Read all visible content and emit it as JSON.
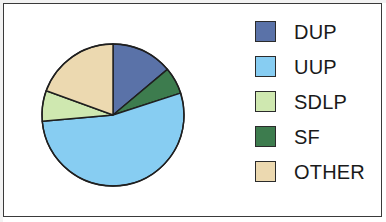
{
  "figure": {
    "background_color": "#ffffff",
    "border_color": "#3a3a3a"
  },
  "legend": {
    "items": [
      {
        "label": "DUP",
        "color": "#5a72a8",
        "border": "#2b2b2b",
        "swatch_name": "legend-swatch-dup"
      },
      {
        "label": "UUP",
        "color": "#87cdf2",
        "border": "#2b2b2b",
        "swatch_name": "legend-swatch-uup"
      },
      {
        "label": "SDLP",
        "color": "#cfe8b0",
        "border": "#2b2b2b",
        "swatch_name": "legend-swatch-sdlp"
      },
      {
        "label": "SF",
        "color": "#3d7c4e",
        "border": "#2b2b2b",
        "swatch_name": "legend-swatch-sf"
      },
      {
        "label": "OTHER",
        "color": "#ecd9b0",
        "border": "#2b2b2b",
        "swatch_name": "legend-swatch-other"
      }
    ]
  },
  "chart_data": {
    "type": "pie",
    "title": "",
    "subtitle": "",
    "xlabel": "",
    "ylabel": "",
    "grid": false,
    "legend_position": "right",
    "start_angle_deg": 0,
    "direction": "clockwise",
    "categories": [
      "DUP",
      "UUP",
      "SDLP",
      "SF",
      "OTHER"
    ],
    "values": [
      13.9,
      53.6,
      6.9,
      6.1,
      19.4
    ],
    "units": "percent",
    "slices": [
      {
        "label": "DUP",
        "value": 13.9,
        "color": "#5a72a8",
        "start_angle_deg": 0,
        "end_angle_deg": 50
      },
      {
        "label": "SF",
        "value": 6.1,
        "color": "#3d7c4e",
        "start_angle_deg": 50,
        "end_angle_deg": 72
      },
      {
        "label": "UUP",
        "value": 53.6,
        "color": "#87cdf2",
        "start_angle_deg": 72,
        "end_angle_deg": 265
      },
      {
        "label": "SDLP",
        "value": 6.9,
        "color": "#cfe8b0",
        "start_angle_deg": 265,
        "end_angle_deg": 290
      },
      {
        "label": "OTHER",
        "value": 19.4,
        "color": "#ecd9b0",
        "start_angle_deg": 290,
        "end_angle_deg": 360
      }
    ],
    "slice_border_color": "#1f1f1f",
    "center_x": 73,
    "center_y": 73,
    "radius": 71
  }
}
